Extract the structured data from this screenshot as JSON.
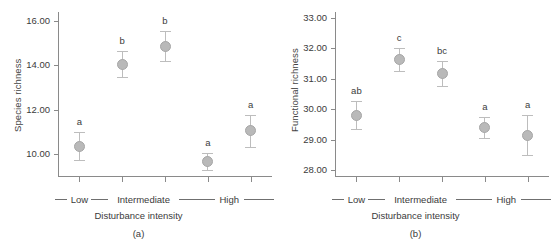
{
  "figure": {
    "background": "#ffffff",
    "marker_color": "#b9b9b9",
    "errorbar_color": "#bdbdbd",
    "axis_color": "#8a8a8a",
    "text_color": "#3b3b3b"
  },
  "chart_data": [
    {
      "type": "scatter",
      "panel": "a",
      "caption": "(a)",
      "title": "",
      "xlabel": "Disturbance intensity",
      "ylabel": "Species richness",
      "categories": [
        "Low",
        "Intermediate 1",
        "Intermediate 2",
        "High 1",
        "High 2"
      ],
      "group_labels": [
        "Low",
        "Intermediate",
        "High"
      ],
      "ytick_labels": [
        "16.00",
        "14.00",
        "12.00",
        "10.00"
      ],
      "ytick_values": [
        16,
        14,
        12,
        10
      ],
      "ylim": [
        9.0,
        16.4
      ],
      "grid": false,
      "legend": "none",
      "values": [
        10.35,
        14.05,
        14.85,
        9.65,
        11.05
      ],
      "err_low": [
        0.62,
        0.58,
        0.68,
        0.38,
        0.72
      ],
      "err_high": [
        0.62,
        0.58,
        0.68,
        0.38,
        0.72
      ],
      "annotations": [
        "a",
        "b",
        "b",
        "a",
        "a"
      ]
    },
    {
      "type": "scatter",
      "panel": "b",
      "caption": "(b)",
      "title": "",
      "xlabel": "Disturbance intensity",
      "ylabel": "Functional richness",
      "categories": [
        "Low",
        "Intermediate 1",
        "Intermediate 2",
        "High 1",
        "High 2"
      ],
      "group_labels": [
        "Low",
        "Intermediate",
        "High"
      ],
      "ytick_labels": [
        "33.00",
        "32.00",
        "31.00",
        "30.00",
        "29.00",
        "28.00"
      ],
      "ytick_values": [
        33,
        32,
        31,
        30,
        29,
        28
      ],
      "ylim": [
        27.8,
        33.2
      ],
      "grid": false,
      "legend": "none",
      "values": [
        29.8,
        31.65,
        31.18,
        29.4,
        29.15
      ],
      "err_low": [
        0.46,
        0.38,
        0.42,
        0.34,
        0.65
      ],
      "err_high": [
        0.46,
        0.38,
        0.42,
        0.34,
        0.65
      ],
      "annotations": [
        "ab",
        "c",
        "bc",
        "a",
        "a"
      ]
    }
  ]
}
